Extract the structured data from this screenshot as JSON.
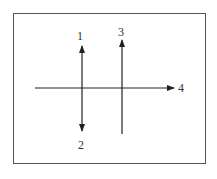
{
  "diagram": {
    "labels": {
      "arrow1": "1",
      "arrow2": "2",
      "arrow3": "3",
      "arrow4": "4"
    },
    "caption": "",
    "colors": {
      "stroke": "#222222",
      "border": "#555555"
    }
  }
}
